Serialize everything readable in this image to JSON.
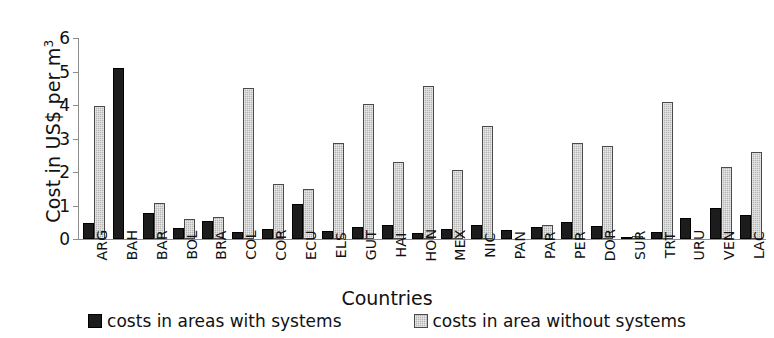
{
  "chart_data": {
    "type": "bar",
    "title": "",
    "xlabel": "Countries",
    "ylabel": "Cost in US$ per m",
    "ylabel_superscript": "3",
    "ylim": [
      0,
      6
    ],
    "yticks": [
      0,
      1,
      2,
      3,
      4,
      5,
      6
    ],
    "ytick_labels": [
      "0",
      "1",
      "2",
      "3",
      "4",
      "5",
      "6"
    ],
    "grid": false,
    "legend_position": "bottom",
    "categories": [
      "ARG",
      "BAH",
      "BAR",
      "BOL",
      "BRA",
      "COL",
      "COR",
      "ECU",
      "ELS",
      "GUT",
      "HAI",
      "HON",
      "MEX",
      "NIC",
      "PAN",
      "PAR",
      "PER",
      "DOR",
      "SUR",
      "TRT",
      "URU",
      "VEN",
      "LAC"
    ],
    "series": [
      {
        "name": "costs in areas with systems",
        "color": "#1c1c1c",
        "values": [
          0.48,
          5.1,
          0.78,
          0.33,
          0.55,
          0.22,
          0.3,
          1.05,
          0.25,
          0.37,
          0.42,
          0.18,
          0.3,
          0.42,
          0.27,
          0.35,
          0.5,
          0.38,
          0.07,
          0.22,
          0.63,
          0.92,
          0.72
        ]
      },
      {
        "name": "costs in area without systems",
        "color": "#b4b4b4",
        "values": [
          3.98,
          0,
          1.08,
          0.6,
          0.65,
          4.5,
          1.65,
          1.5,
          2.88,
          4.03,
          2.3,
          4.57,
          2.07,
          3.38,
          0,
          0.42,
          2.88,
          2.77,
          0.08,
          4.1,
          0,
          2.15,
          2.6
        ]
      }
    ]
  },
  "legend": {
    "items": [
      {
        "label": "costs in areas with systems",
        "swatch": "dark"
      },
      {
        "label": "costs in area without systems",
        "swatch": "light"
      }
    ]
  }
}
